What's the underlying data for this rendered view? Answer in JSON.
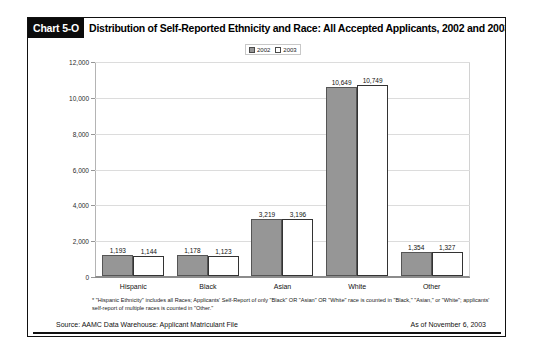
{
  "header": {
    "chart_number": "Chart 5-O",
    "title": "Distribution of Self-Reported Ethnicity and Race: All Accepted Applicants, 2002 and 2003*"
  },
  "footnote": "* \"Hispanic Ethnicity\" includes all Races; Applicants' Self-Report of only \"Black\" OR \"Asian\" OR \"White\" race is counted in \"Black,\" \"Asian,\" or \"White\"; applicants' self-report of multiple races is counted in \"Other.\"",
  "source": "Source: AAMC Data Warehouse: Applicant Matriculant File",
  "as_of": "As of November 6, 2003",
  "colors": {
    "series_2002": "#969696",
    "series_2003": "#ffffff",
    "bar_border": "#333333",
    "title_bar": "#0b0b0b",
    "gridline": "#dcdcdc"
  },
  "chart_data": {
    "type": "bar",
    "title": "Distribution of Self-Reported Ethnicity and Race: All Accepted Applicants, 2002 and 2003*",
    "xlabel": "",
    "ylabel": "",
    "categories": [
      "Hispanic",
      "Black",
      "Asian",
      "White",
      "Other"
    ],
    "series": [
      {
        "name": "2002",
        "values": [
          1193,
          1178,
          3219,
          10649,
          1354
        ],
        "labels": [
          "1,193",
          "1,178",
          "3,219",
          "10,649",
          "1,354"
        ]
      },
      {
        "name": "2003",
        "values": [
          1144,
          1123,
          3196,
          10749,
          1327
        ],
        "labels": [
          "1,144",
          "1,123",
          "3,196",
          "10,749",
          "1,327"
        ]
      }
    ],
    "ylim": [
      0,
      12000
    ],
    "yticks": [
      0,
      2000,
      4000,
      6000,
      8000,
      10000,
      12000
    ],
    "ytick_labels": [
      "0",
      "2,000",
      "4,000",
      "6,000",
      "8,000",
      "10,000",
      "12,000"
    ],
    "grid": true,
    "legend": [
      "2002",
      "2003"
    ],
    "legend_position": "top-center"
  }
}
